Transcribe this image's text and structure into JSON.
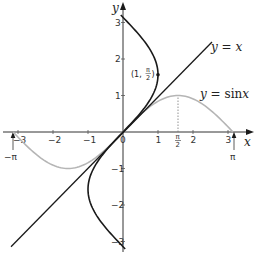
{
  "chart_data": {
    "type": "line",
    "title": "",
    "xlabel": "x",
    "ylabel": "y",
    "xlim": [
      -3.4,
      3.6
    ],
    "ylim": [
      -3.2,
      3.5
    ],
    "x_ticks": [
      "-3",
      "-2",
      "-1",
      "0",
      "1",
      "2",
      "3"
    ],
    "y_ticks": [
      "-3",
      "-2",
      "-1",
      "1",
      "2",
      "3"
    ],
    "special_x_ticks": [
      {
        "value": 1.5708,
        "label_num": "π",
        "label_den": "2"
      },
      {
        "value": 3.1416,
        "label": "π"
      },
      {
        "value": -3.1416,
        "label": "−π"
      }
    ],
    "series": [
      {
        "name": "y = x",
        "label": "y = x",
        "color": "#1a1a1a",
        "kind": "line",
        "x": [
          -3.2,
          2.5
        ],
        "y": [
          -3.2,
          2.5
        ]
      },
      {
        "name": "y = sin x",
        "label": "y = sin x",
        "color": "#b0b0b0",
        "kind": "function",
        "domain": [
          -3.1416,
          3.1416
        ]
      },
      {
        "name": "x = sin y",
        "label": "",
        "color": "#1a1a1a",
        "kind": "inverse",
        "range": [
          -3.1416,
          3.1416
        ]
      }
    ],
    "annotations": [
      {
        "type": "point",
        "x": 1,
        "y": 1.5708,
        "label": "(1, π/2)"
      },
      {
        "type": "dotted-vline",
        "x": 1.5708,
        "from_y": 0,
        "to_y": 1
      }
    ],
    "grid": false,
    "legend": "inline labels"
  },
  "labels": {
    "x_axis": "x",
    "y_axis": "y",
    "line_label": "y = x",
    "sin_label_prefix": "y = ",
    "sin_label_fn": "sin",
    "sin_label_var": "x",
    "point_label_prefix": "(1, ",
    "point_label_suffix": ")",
    "pi_num": "π",
    "pi_den": "2",
    "pi": "π",
    "neg_pi": "−π",
    "origin": "0"
  }
}
